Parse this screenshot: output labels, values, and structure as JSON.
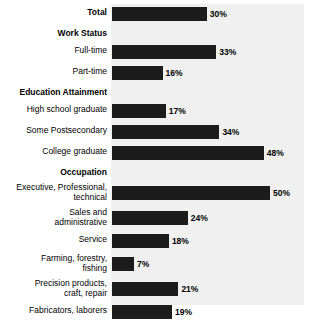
{
  "chart_data": {
    "type": "bar",
    "orientation": "horizontal",
    "title": "",
    "xlabel": "",
    "ylabel": "",
    "xlim": [
      0,
      61
    ],
    "grid": false,
    "legend": false,
    "value_suffix": "%",
    "groups": [
      {
        "header": "",
        "rows": [
          {
            "label": "Total",
            "value": 30,
            "value_label": "30%",
            "bold_label": true,
            "lines": 1
          }
        ]
      },
      {
        "header": "Work Status",
        "rows": [
          {
            "label": "Full-time",
            "value": 33,
            "value_label": "33%",
            "bold_label": false,
            "lines": 1
          },
          {
            "label": "Part-time",
            "value": 16,
            "value_label": "16%",
            "bold_label": false,
            "lines": 1
          }
        ]
      },
      {
        "header": "Education Attainment",
        "rows": [
          {
            "label": "High school graduate",
            "value": 17,
            "value_label": "17%",
            "bold_label": false,
            "lines": 1
          },
          {
            "label": "Some Postsecondary",
            "value": 34,
            "value_label": "34%",
            "bold_label": false,
            "lines": 1
          },
          {
            "label": "College graduate",
            "value": 48,
            "value_label": "48%",
            "bold_label": false,
            "lines": 1
          }
        ]
      },
      {
        "header": "Occupation",
        "rows": [
          {
            "label": "Executive, Professional,\ntechnical",
            "value": 50,
            "value_label": "50%",
            "bold_label": false,
            "lines": 2
          },
          {
            "label": "Sales and\nadministrative",
            "value": 24,
            "value_label": "24%",
            "bold_label": false,
            "lines": 2
          },
          {
            "label": "Service",
            "value": 18,
            "value_label": "18%",
            "bold_label": false,
            "lines": 1
          },
          {
            "label": "Farming, forestry,\nfishing",
            "value": 7,
            "value_label": "7%",
            "bold_label": false,
            "lines": 2
          },
          {
            "label": "Precision products,\ncraft, repair",
            "value": 21,
            "value_label": "21%",
            "bold_label": false,
            "lines": 2
          },
          {
            "label": "Fabricators, laborers",
            "value": 19,
            "value_label": "19%",
            "bold_label": false,
            "lines": 1
          }
        ]
      }
    ],
    "categories": [
      "Total",
      "Full-time",
      "Part-time",
      "High school graduate",
      "Some Postsecondary",
      "College graduate",
      "Executive, Professional, technical",
      "Sales and administrative",
      "Service",
      "Farming, forestry, fishing",
      "Precision products, craft, repair",
      "Fabricators, laborers"
    ],
    "values": [
      30,
      33,
      16,
      17,
      34,
      48,
      50,
      24,
      18,
      7,
      21,
      19
    ]
  },
  "style": {
    "bar_color": "#1c1c1c",
    "plot_background": "#f0f0f0",
    "page_background": "#ffffff",
    "text_color": "#000000"
  }
}
